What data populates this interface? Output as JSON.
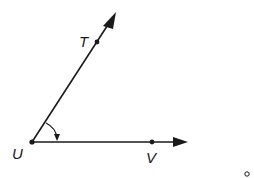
{
  "diagram": {
    "type": "angle",
    "angle_name": "TUV",
    "vertex": {
      "label": "U",
      "x": 32,
      "y": 142
    },
    "ray_ut": {
      "point_label": "T",
      "point": {
        "x": 97,
        "y": 42
      },
      "tip": {
        "x": 116,
        "y": 12
      }
    },
    "ray_uv": {
      "point_label": "V",
      "point": {
        "x": 152,
        "y": 142
      },
      "tip": {
        "x": 188,
        "y": 142
      }
    },
    "labels": {
      "T": "T",
      "U": "U",
      "V": "V"
    },
    "stroke_color": "#1a1a1a",
    "degree_mark": "o"
  }
}
